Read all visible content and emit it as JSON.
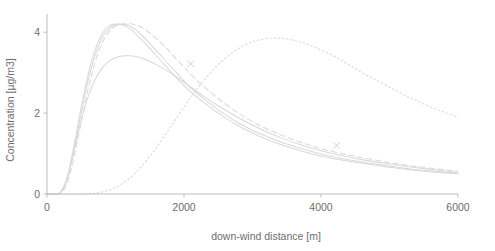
{
  "chart_data": {
    "type": "line",
    "title": "",
    "xlabel": "down-wind distance [m]",
    "ylabel": "Concentration [µg/m3]",
    "xlim": [
      0,
      6000
    ],
    "ylim": [
      0,
      4.45
    ],
    "xticks": [
      0,
      2000,
      4000,
      6000
    ],
    "xtick_labels": [
      "0",
      "2000",
      "4000",
      "6000"
    ],
    "yticks": [
      0,
      2,
      4
    ],
    "ytick_labels": [
      "0",
      "2",
      "4"
    ],
    "grid": false,
    "legend": "none",
    "series": [
      {
        "name": "solid-curve-1",
        "style": "solid",
        "color": "#d9d9d9",
        "x": [
          0,
          100,
          200,
          300,
          400,
          500,
          600,
          700,
          800,
          900,
          1000,
          1100,
          1200,
          1300,
          1400,
          1500,
          1700,
          1900,
          2100,
          2300,
          2500,
          2800,
          3100,
          3400,
          3700,
          4000,
          4300,
          4600,
          5000,
          5400,
          5800,
          6000
        ],
        "y": [
          0.0,
          0.0,
          0.05,
          0.45,
          1.25,
          2.15,
          2.95,
          3.55,
          3.95,
          4.15,
          4.2,
          4.18,
          4.1,
          3.95,
          3.78,
          3.6,
          3.22,
          2.85,
          2.52,
          2.25,
          2.0,
          1.68,
          1.43,
          1.23,
          1.07,
          0.94,
          0.84,
          0.76,
          0.66,
          0.58,
          0.52,
          0.5
        ]
      },
      {
        "name": "solid-curve-2",
        "style": "solid",
        "color": "#d9d9d9",
        "x": [
          0,
          100,
          200,
          300,
          400,
          500,
          600,
          700,
          800,
          900,
          1000,
          1100,
          1200,
          1300,
          1400,
          1500,
          1700,
          1900,
          2100,
          2300,
          2500,
          2800,
          3100,
          3400,
          3700,
          4000,
          4300,
          4600,
          5000,
          5400,
          5800,
          6000
        ],
        "y": [
          0.0,
          0.0,
          0.04,
          0.4,
          1.15,
          2.0,
          2.8,
          3.42,
          3.85,
          4.08,
          4.18,
          4.2,
          4.16,
          4.05,
          3.9,
          3.72,
          3.35,
          2.98,
          2.62,
          2.34,
          2.08,
          1.75,
          1.5,
          1.29,
          1.13,
          0.99,
          0.88,
          0.79,
          0.69,
          0.6,
          0.54,
          0.52
        ]
      },
      {
        "name": "dashed-curve",
        "style": "dashed",
        "color": "#d9d9d9",
        "x": [
          0,
          100,
          200,
          300,
          400,
          500,
          600,
          700,
          800,
          900,
          1000,
          1100,
          1200,
          1300,
          1400,
          1500,
          1700,
          1900,
          2100,
          2300,
          2500,
          2800,
          3100,
          3400,
          3700,
          4000,
          4300,
          4600,
          5000,
          5400,
          5800,
          6000
        ],
        "y": [
          0.0,
          0.0,
          0.02,
          0.3,
          0.95,
          1.78,
          2.58,
          3.25,
          3.72,
          4.0,
          4.15,
          4.2,
          4.21,
          4.18,
          4.1,
          3.98,
          3.68,
          3.32,
          2.96,
          2.64,
          2.36,
          1.99,
          1.7,
          1.47,
          1.28,
          1.12,
          1.0,
          0.9,
          0.78,
          0.68,
          0.6,
          0.57
        ]
      },
      {
        "name": "lower-solid-curve",
        "style": "solid",
        "color": "#d9d9d9",
        "x": [
          0,
          100,
          200,
          300,
          400,
          500,
          600,
          700,
          800,
          900,
          1000,
          1100,
          1200,
          1300,
          1400,
          1500,
          1700,
          1900,
          2100,
          2300,
          2500,
          2800,
          3100,
          3400,
          3700,
          4000,
          4300,
          4600,
          5000,
          5400,
          5800,
          6000
        ],
        "y": [
          0.0,
          0.0,
          0.04,
          0.42,
          1.1,
          1.82,
          2.4,
          2.82,
          3.1,
          3.28,
          3.37,
          3.41,
          3.42,
          3.4,
          3.35,
          3.28,
          3.1,
          2.88,
          2.64,
          2.4,
          2.18,
          1.88,
          1.62,
          1.4,
          1.22,
          1.07,
          0.95,
          0.85,
          0.74,
          0.65,
          0.57,
          0.54
        ]
      },
      {
        "name": "dotted-curve",
        "style": "dotted",
        "color": "#d9d9d9",
        "x": [
          0,
          200,
          400,
          600,
          800,
          1000,
          1200,
          1400,
          1600,
          1800,
          2000,
          2200,
          2400,
          2600,
          2800,
          3000,
          3200,
          3400,
          3600,
          3800,
          4000,
          4200,
          4400,
          4600,
          4800,
          5000,
          5200,
          5400,
          5600,
          5800,
          6000
        ],
        "y": [
          0.0,
          0.0,
          0.0,
          0.01,
          0.05,
          0.16,
          0.38,
          0.72,
          1.15,
          1.65,
          2.15,
          2.62,
          3.02,
          3.35,
          3.6,
          3.76,
          3.84,
          3.85,
          3.8,
          3.7,
          3.56,
          3.4,
          3.2,
          3.0,
          2.82,
          2.64,
          2.46,
          2.3,
          2.15,
          2.02,
          1.9
        ]
      }
    ],
    "markers": [
      {
        "name": "x-marker-1",
        "x": 2100,
        "y": 3.22,
        "symbol": "x"
      },
      {
        "name": "x-marker-2",
        "x": 4230,
        "y": 1.2,
        "symbol": "x"
      }
    ]
  },
  "colors": {
    "curve": "#d9d9d9",
    "axis": "#bdbdbd",
    "text": "#6e6e6e",
    "background": "#ffffff"
  }
}
